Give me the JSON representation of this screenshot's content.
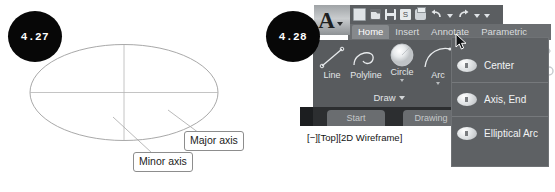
{
  "figures": [
    {
      "number": "4.27",
      "type": "ellipse-diagram",
      "callouts": [
        {
          "name": "major-axis",
          "label": "Major axis"
        },
        {
          "name": "minor-axis",
          "label": "Minor axis"
        }
      ]
    },
    {
      "number": "4.28",
      "type": "autocad-ribbon-screenshot"
    }
  ],
  "autocad": {
    "app_button": {
      "glyph": "A",
      "name": "application-menu"
    },
    "quick_access": {
      "items": [
        {
          "name": "new-icon",
          "label": "New"
        },
        {
          "name": "open-icon",
          "label": "Open"
        },
        {
          "name": "save-icon",
          "label": "Save"
        },
        {
          "name": "save-as-icon",
          "label": "Save As"
        },
        {
          "name": "plot-icon",
          "label": "Plot"
        },
        {
          "name": "undo-icon",
          "label": "Undo"
        },
        {
          "name": "redo-icon",
          "label": "Redo"
        }
      ]
    },
    "tabs": [
      {
        "label": "Home",
        "active": true
      },
      {
        "label": "Insert",
        "active": false
      },
      {
        "label": "Annotate",
        "active": false
      },
      {
        "label": "Parametric",
        "active": false
      }
    ],
    "draw_panel": {
      "title": "Draw",
      "tools": [
        {
          "label": "Line",
          "icon": "line-icon",
          "has_caret": false
        },
        {
          "label": "Polyline",
          "icon": "polyline-icon",
          "has_caret": false
        },
        {
          "label": "Circle",
          "icon": "circle-icon",
          "has_caret": true
        },
        {
          "label": "Arc",
          "icon": "arc-icon",
          "has_caret": true
        }
      ]
    },
    "modify_icons": [
      {
        "name": "rectangle-icon"
      },
      {
        "name": "move-icon"
      },
      {
        "name": "rotate-icon"
      },
      {
        "name": "ellipse-icon"
      },
      {
        "name": "copy-icon"
      },
      {
        "name": "mirror-icon"
      }
    ],
    "flyout": {
      "name": "ellipse-flyout-menu",
      "items": [
        {
          "label": "Center",
          "icon": "ellipse-center-icon"
        },
        {
          "label": "Axis, End",
          "icon": "ellipse-axis-end-icon"
        },
        {
          "label": "Elliptical Arc",
          "icon": "elliptical-arc-icon"
        }
      ]
    },
    "file_tabs": [
      {
        "label": "Start"
      },
      {
        "label": "Drawing"
      }
    ],
    "viewport_label": "[−][Top][2D Wireframe]"
  },
  "colors": {
    "ribbon_bg": "#585b5e",
    "tab_bar_bg": "#6a6d70",
    "active_tab_bg": "#86898c",
    "flyout_bg": "#5e6164",
    "badge_bg": "#070707",
    "text_light": "#e4e7e9",
    "ellipse_stroke": "#9a9a9a",
    "callout_border": "#8d8d8d"
  }
}
